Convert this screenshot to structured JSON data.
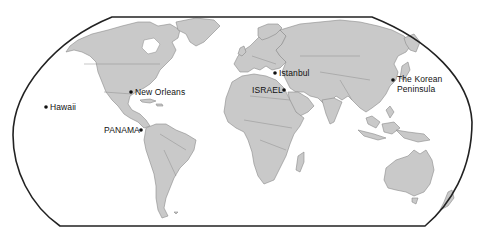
{
  "map": {
    "projection": "robinson-world",
    "colors": {
      "land": "#c9c9c9",
      "land_outline": "#8a8a8a",
      "ocean": "#ffffff",
      "frame": "#222222",
      "marker": "#111111"
    },
    "markers": [
      {
        "id": "hawaii",
        "label": "Hawaii",
        "x": 46,
        "y": 107,
        "label_side": "right"
      },
      {
        "id": "new-orleans",
        "label": "New Orleans",
        "x": 131,
        "y": 92,
        "label_side": "right"
      },
      {
        "id": "panama",
        "label": "PANAMA",
        "x": 141,
        "y": 130,
        "label_side": "left"
      },
      {
        "id": "istanbul",
        "label": "Istanbul",
        "x": 275,
        "y": 73,
        "label_side": "right"
      },
      {
        "id": "israel",
        "label": "ISRAEL",
        "x": 284,
        "y": 90,
        "label_side": "left"
      },
      {
        "id": "korean-peninsula",
        "label_line1": "The Korean",
        "label_line2": "Peninsula",
        "x": 393,
        "y": 80,
        "label_side": "right"
      }
    ]
  }
}
